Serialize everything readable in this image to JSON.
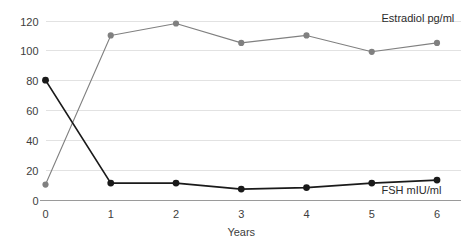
{
  "chart_data": {
    "type": "line",
    "title": "",
    "subtitle": "",
    "xlabel": "Years",
    "ylabel": "",
    "x": [
      0,
      1,
      2,
      3,
      4,
      5,
      6
    ],
    "xtick_labels": [
      "0",
      "1",
      "2",
      "3",
      "4",
      "5",
      "6"
    ],
    "ytick_labels": [
      "0",
      "20",
      "40",
      "60",
      "80",
      "100",
      "120"
    ],
    "ytick_values": [
      0,
      20,
      40,
      60,
      80,
      100,
      120
    ],
    "xlim": [
      0,
      6
    ],
    "ylim": [
      0,
      120
    ],
    "grid": "horizontal",
    "legend_position": "inline-annotation",
    "series": [
      {
        "name": "Estradiol  pg/ml",
        "label": "Estradiol  pg/ml",
        "unit": "pg/ml",
        "color": "#808080",
        "marker": "circle",
        "values": [
          10,
          110,
          118,
          105,
          110,
          99,
          105
        ],
        "annotation_x": 5.15,
        "annotation_y": 119
      },
      {
        "name": "FSH mIU/ml",
        "label": "FSH mIU/ml",
        "unit": "mIU/ml",
        "color": "#1a1a1a",
        "marker": "circle",
        "values": [
          80,
          11,
          11,
          7,
          8,
          11,
          13
        ],
        "annotation_x": 5.15,
        "annotation_y": 4
      }
    ]
  },
  "axes": {
    "x_axis_title": "Years",
    "y_axis_title": ""
  },
  "colors": {
    "background": "#ffffff",
    "gridline": "#e2e2e2",
    "axis": "#9a9a9a",
    "estradiol": "#808080",
    "fsh": "#1a1a1a",
    "tick_text": "#3d3d3d"
  }
}
